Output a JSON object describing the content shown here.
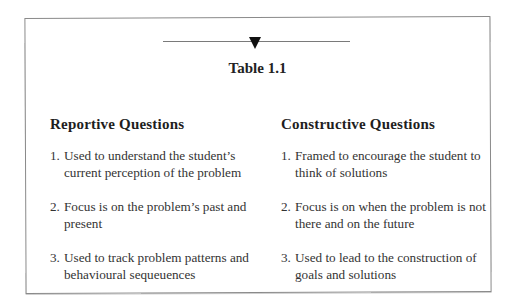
{
  "table": {
    "title": "Table 1.1",
    "columns": [
      {
        "heading": "Reportive Questions",
        "items": [
          {
            "num": "1.",
            "text": "Used to understand the student’s current perception of the problem"
          },
          {
            "num": "2.",
            "text": "Focus is on the problem’s past and present"
          },
          {
            "num": "3.",
            "text": "Used to track problem patterns and behavioural sequeuences"
          }
        ]
      },
      {
        "heading": "Constructive Questions",
        "items": [
          {
            "num": "1.",
            "text": "Framed to encourage the student to think of solutions"
          },
          {
            "num": "2.",
            "text": "Focus is on when the problem is not there and on the future"
          },
          {
            "num": "3.",
            "text": "Used to lead to the construction of goals and solutions"
          }
        ]
      }
    ]
  },
  "icons": {
    "divider_marker": "down-triangle"
  }
}
